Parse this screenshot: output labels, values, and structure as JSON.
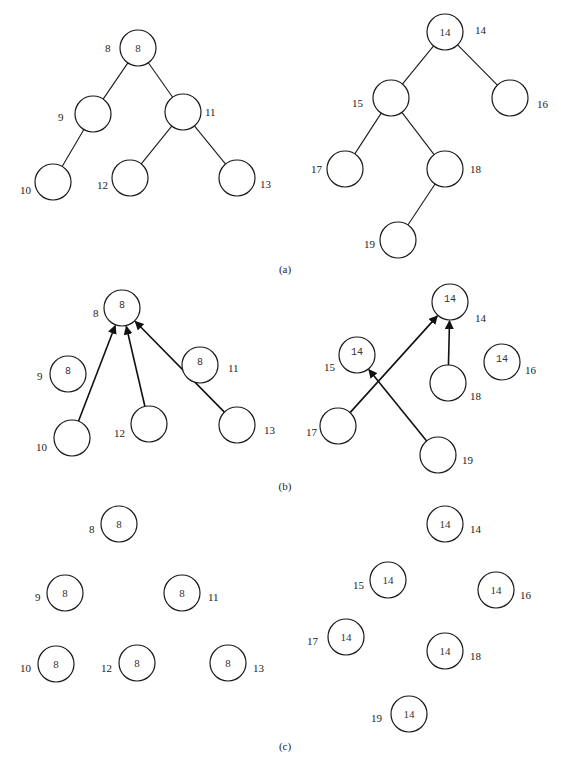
{
  "figure": {
    "captions": {
      "a": "(a)",
      "b": "(b)",
      "c": "(c)"
    },
    "panel_a": {
      "description": "Two trees (initial parent-pointer forest)",
      "left_tree": {
        "nodes": [
          {
            "id": "8",
            "label": "8",
            "value": "8"
          },
          {
            "id": "9",
            "label": "9",
            "value": ""
          },
          {
            "id": "11",
            "label": "11",
            "value": ""
          },
          {
            "id": "10",
            "label": "10",
            "value": ""
          },
          {
            "id": "12",
            "label": "12",
            "value": ""
          },
          {
            "id": "13",
            "label": "13",
            "value": ""
          }
        ],
        "edges": [
          [
            "8",
            "9"
          ],
          [
            "8",
            "11"
          ],
          [
            "9",
            "10"
          ],
          [
            "11",
            "12"
          ],
          [
            "11",
            "13"
          ]
        ]
      },
      "right_tree": {
        "nodes": [
          {
            "id": "14",
            "label": "14",
            "value": "14"
          },
          {
            "id": "15",
            "label": "15",
            "value": ""
          },
          {
            "id": "16",
            "label": "16",
            "value": ""
          },
          {
            "id": "17",
            "label": "17",
            "value": ""
          },
          {
            "id": "18",
            "label": "18",
            "value": ""
          },
          {
            "id": "19",
            "label": "19",
            "value": ""
          }
        ],
        "edges": [
          [
            "14",
            "15"
          ],
          [
            "14",
            "16"
          ],
          [
            "15",
            "17"
          ],
          [
            "15",
            "18"
          ],
          [
            "18",
            "19"
          ]
        ]
      }
    },
    "panel_b": {
      "description": "Pointer jumping step",
      "left": {
        "nodes": [
          {
            "id": "8",
            "label": "8",
            "value": "8"
          },
          {
            "id": "9",
            "label": "9",
            "value": "8"
          },
          {
            "id": "11",
            "label": "11",
            "value": "8"
          },
          {
            "id": "10",
            "label": "10",
            "value": ""
          },
          {
            "id": "12",
            "label": "12",
            "value": ""
          },
          {
            "id": "13",
            "label": "13",
            "value": ""
          }
        ],
        "arrows": [
          [
            "10",
            "8"
          ],
          [
            "12",
            "8"
          ],
          [
            "13",
            "8"
          ]
        ]
      },
      "right": {
        "nodes": [
          {
            "id": "14",
            "label": "14",
            "value": "14"
          },
          {
            "id": "15",
            "label": "15",
            "value": "14"
          },
          {
            "id": "16",
            "label": "16",
            "value": "14"
          },
          {
            "id": "17",
            "label": "17",
            "value": ""
          },
          {
            "id": "18",
            "label": "18",
            "value": ""
          },
          {
            "id": "19",
            "label": "19",
            "value": ""
          }
        ],
        "arrows": [
          [
            "17",
            "14"
          ],
          [
            "18",
            "14"
          ],
          [
            "19",
            "15"
          ]
        ]
      }
    },
    "panel_c": {
      "description": "All nodes point to root",
      "left": {
        "nodes": [
          {
            "id": "8",
            "label": "8",
            "value": "8"
          },
          {
            "id": "9",
            "label": "9",
            "value": "8"
          },
          {
            "id": "11",
            "label": "11",
            "value": "8"
          },
          {
            "id": "10",
            "label": "10",
            "value": "8"
          },
          {
            "id": "12",
            "label": "12",
            "value": "8"
          },
          {
            "id": "13",
            "label": "13",
            "value": "8"
          }
        ]
      },
      "right": {
        "nodes": [
          {
            "id": "14",
            "label": "14",
            "value": "14"
          },
          {
            "id": "15",
            "label": "15",
            "value": "14"
          },
          {
            "id": "16",
            "label": "16",
            "value": "14"
          },
          {
            "id": "17",
            "label": "17",
            "value": "14"
          },
          {
            "id": "18",
            "label": "18",
            "value": "14"
          },
          {
            "id": "19",
            "label": "19",
            "value": "14"
          }
        ]
      }
    }
  }
}
